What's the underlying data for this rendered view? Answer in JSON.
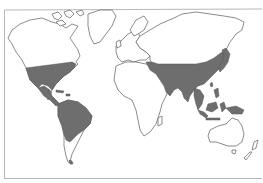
{
  "map": {
    "type": "world-outline-map",
    "colors": {
      "background": "#ffffff",
      "land_outline": "#6f6f6f",
      "shaded_region": "#6e6e6e",
      "frame": "#b8b8b8"
    },
    "shaded_regions": [
      "southeastern-united-states",
      "mexico-central-america",
      "caribbean",
      "northern-south-america",
      "eastern-mediterranean-middle-east-band",
      "south-asia",
      "china-east-asia",
      "japan",
      "southeast-asia",
      "indonesia-new-guinea"
    ],
    "unshaded_regions": [
      "canada-alaska",
      "greenland",
      "europe",
      "russia-siberia",
      "africa",
      "southern-south-america",
      "australia",
      "new-zealand"
    ]
  }
}
